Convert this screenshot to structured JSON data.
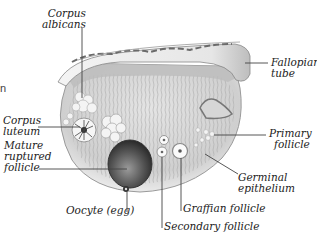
{
  "diagram": {
    "edge_fragment": "n",
    "labels": {
      "corpus_albicans": {
        "line1": "Corpus",
        "line2": "albicans"
      },
      "fallopian_tube": {
        "line1": "Fallopian",
        "line2": "tube"
      },
      "corpus_luteum": {
        "line1": "Corpus",
        "line2": "luteum"
      },
      "mature_ruptured_follicle": {
        "line1": "Mature",
        "line2": "ruptured",
        "line3": "follicle"
      },
      "primary_follicle": {
        "line1": "Primary",
        "line2": "follicle"
      },
      "germinal_epithelium": {
        "line1": "Germinal",
        "line2": "epithelium"
      },
      "graffian_follicle": {
        "text": "Graffian follicle"
      },
      "oocyte": {
        "text": "Oocyte (egg)"
      },
      "secondary_follicle": {
        "text": "Secondary follicle"
      }
    },
    "colors": {
      "tissue_fill": "#d9d9d9",
      "tissue_dark": "#8a8a8a",
      "capsule": "#6e6e6e",
      "follicle_dark": "#4a4a4a",
      "label_text": "#222222",
      "leader_line": "#444444"
    }
  }
}
